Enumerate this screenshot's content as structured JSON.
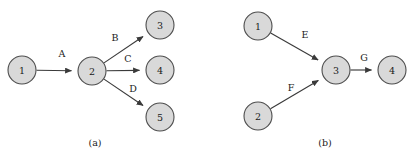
{
  "figure": {
    "type": "directed-graph-diagram",
    "width": 414,
    "height": 159,
    "background_color": "#ffffff",
    "node_fill_color": "#d9d9d9",
    "node_stroke_color": "#4d4d4d",
    "edge_color": "#3a3a3a",
    "text_color": "#1a1a1a",
    "node_radius": 14
  },
  "panels": [
    {
      "id": "panel-a",
      "caption": "(a)",
      "caption_x": 95,
      "caption_y": 142,
      "nodes": [
        {
          "id": "a1",
          "label": "1",
          "cx": 22,
          "cy": 70
        },
        {
          "id": "a2",
          "label": "2",
          "cx": 92,
          "cy": 71
        },
        {
          "id": "a3",
          "label": "3",
          "cx": 160,
          "cy": 25
        },
        {
          "id": "a4",
          "label": "4",
          "cx": 160,
          "cy": 70
        },
        {
          "id": "a5",
          "label": "5",
          "cx": 160,
          "cy": 117
        }
      ],
      "edges": [
        {
          "id": "edge-a",
          "label": "A",
          "from": "a1",
          "to": "a2",
          "label_x": 62,
          "label_y": 53
        },
        {
          "id": "edge-b",
          "label": "B",
          "from": "a2",
          "to": "a3",
          "label_x": 115,
          "label_y": 37
        },
        {
          "id": "edge-c",
          "label": "C",
          "from": "a2",
          "to": "a4",
          "label_x": 128,
          "label_y": 58
        },
        {
          "id": "edge-d",
          "label": "D",
          "from": "a2",
          "to": "a5",
          "label_x": 133,
          "label_y": 88
        }
      ]
    },
    {
      "id": "panel-b",
      "caption": "(b)",
      "caption_x": 325,
      "caption_y": 142,
      "nodes": [
        {
          "id": "b1",
          "label": "1",
          "cx": 258,
          "cy": 26
        },
        {
          "id": "b2",
          "label": "2",
          "cx": 258,
          "cy": 116
        },
        {
          "id": "b3",
          "label": "3",
          "cx": 336,
          "cy": 70
        },
        {
          "id": "b4",
          "label": "4",
          "cx": 392,
          "cy": 70
        }
      ],
      "edges": [
        {
          "id": "edge-e",
          "label": "E",
          "from": "b1",
          "to": "b3",
          "label_x": 305,
          "label_y": 34
        },
        {
          "id": "edge-f",
          "label": "F",
          "from": "b2",
          "to": "b3",
          "label_x": 291,
          "label_y": 87
        },
        {
          "id": "edge-g",
          "label": "G",
          "from": "b3",
          "to": "b4",
          "label_x": 364,
          "label_y": 57
        }
      ]
    }
  ]
}
